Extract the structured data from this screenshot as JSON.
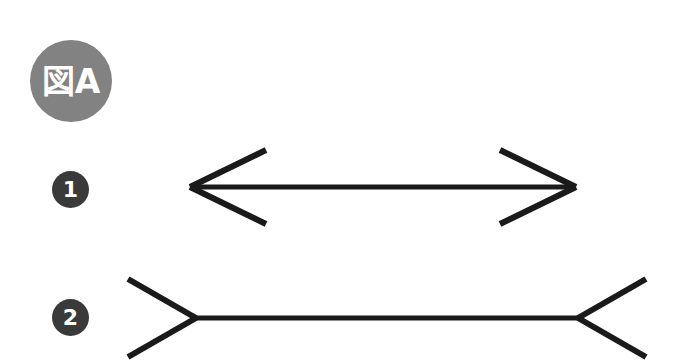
{
  "figure": {
    "badge_label": "図A",
    "badge_color": "#828282",
    "badge_text_color": "#ffffff",
    "background_color": "#ffffff",
    "line_color": "#1a1a1a",
    "marker_color": "#3a3a3a"
  },
  "items": [
    {
      "marker": "❶",
      "marker_number": "1",
      "name": "inward-fins-arrow",
      "description": "double-headed arrow with fins pointing inward",
      "shaft": {
        "x1": 190,
        "y1": 187,
        "x2": 576,
        "y2": 187,
        "length": 386
      },
      "fins": [
        {
          "x1": 190,
          "y1": 187,
          "x2": 266,
          "y2": 150
        },
        {
          "x1": 190,
          "y1": 187,
          "x2": 266,
          "y2": 224
        },
        {
          "x1": 576,
          "y1": 187,
          "x2": 500,
          "y2": 150
        },
        {
          "x1": 576,
          "y1": 187,
          "x2": 500,
          "y2": 224
        }
      ]
    },
    {
      "marker": "❷",
      "marker_number": "2",
      "name": "outward-fins-arrow",
      "description": "line with fins splayed outward at both ends",
      "shaft": {
        "x1": 196,
        "y1": 318,
        "x2": 578,
        "y2": 318,
        "length": 382
      },
      "fins": [
        {
          "x1": 196,
          "y1": 318,
          "x2": 128,
          "y2": 279
        },
        {
          "x1": 196,
          "y1": 318,
          "x2": 128,
          "y2": 357
        },
        {
          "x1": 578,
          "y1": 318,
          "x2": 646,
          "y2": 279
        },
        {
          "x1": 578,
          "y1": 318,
          "x2": 646,
          "y2": 357
        }
      ]
    }
  ]
}
